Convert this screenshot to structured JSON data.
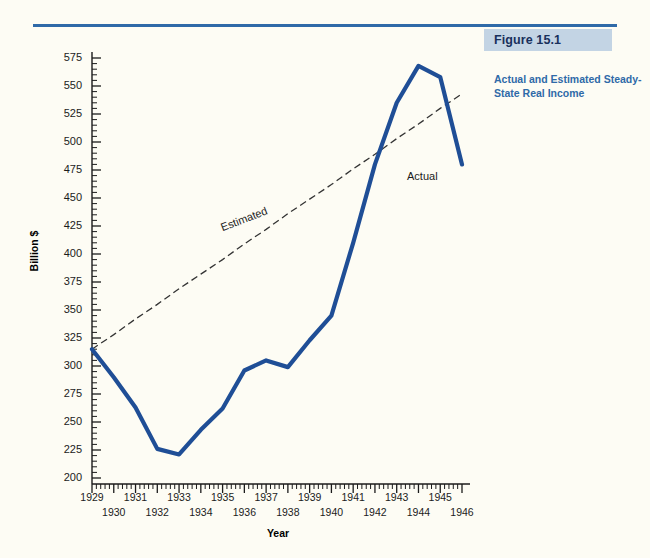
{
  "figure": {
    "banner_label": "Figure 15.1",
    "caption": "Actual and Estimated Steady-State Real Income",
    "accent_color": "#2f6aa8",
    "banner_color": "#c3d4e4",
    "page_background": "#fdfcf4"
  },
  "chart_data": {
    "type": "line",
    "title": "Actual and Estimated Steady-State Real Income",
    "xlabel": "Year",
    "ylabel": "Billion $",
    "xlim": [
      1929,
      1946
    ],
    "ylim": [
      200,
      575
    ],
    "grid": false,
    "legend": "inline-annotations",
    "yticks": [
      200,
      225,
      250,
      275,
      300,
      325,
      350,
      375,
      400,
      425,
      450,
      475,
      500,
      525,
      550,
      575
    ],
    "xticks": [
      1929,
      1930,
      1931,
      1932,
      1933,
      1934,
      1935,
      1936,
      1937,
      1938,
      1939,
      1940,
      1941,
      1942,
      1943,
      1944,
      1945,
      1946
    ],
    "x": [
      1929,
      1930,
      1931,
      1932,
      1933,
      1934,
      1935,
      1936,
      1937,
      1938,
      1939,
      1940,
      1941,
      1942,
      1943,
      1944,
      1945,
      1946
    ],
    "series": [
      {
        "name": "Actual",
        "style": "solid",
        "color": "#1f4e96",
        "values": [
          315,
          290,
          263,
          226,
          221,
          243,
          262,
          296,
          305,
          299,
          323,
          345,
          410,
          480,
          535,
          568,
          558,
          480
        ]
      },
      {
        "name": "Estimated",
        "style": "dashed",
        "color": "#333333",
        "values": [
          315,
          328,
          342,
          355,
          369,
          382,
          395,
          409,
          422,
          436,
          449,
          462,
          476,
          489,
          503,
          516,
          530,
          543
        ]
      }
    ],
    "annotations": [
      {
        "text": "Actual",
        "x": 1945,
        "y": 468
      },
      {
        "text": "Estimated",
        "x": 1935,
        "y": 422
      }
    ]
  },
  "axis": {
    "y_title": "Billion $",
    "x_title": "Year",
    "y_labels": [
      "575",
      "550",
      "525",
      "500",
      "475",
      "450",
      "425",
      "400",
      "375",
      "350",
      "325",
      "300",
      "275",
      "250",
      "225",
      "200"
    ],
    "x_labels_upper": [
      "1929",
      "1931",
      "1933",
      "1935",
      "1937",
      "1939",
      "1941",
      "1943",
      "1945"
    ],
    "x_labels_lower": [
      "1930",
      "1932",
      "1934",
      "1936",
      "1938",
      "1940",
      "1942",
      "1944",
      "1946"
    ]
  },
  "labels": {
    "actual": "Actual",
    "estimated": "Estimated"
  }
}
